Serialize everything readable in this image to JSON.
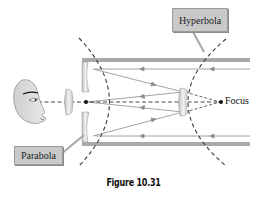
{
  "figure": {
    "caption": "Figure 10.31",
    "labels": {
      "hyperbola": "Hyperbola",
      "parabola": "Parabola",
      "focus": "Focus"
    },
    "colors": {
      "tube": "#a8a8a8",
      "ray": "#8a8a8a",
      "dashed_curve": "#3a3a3a",
      "label_bg": "#c9c9c9",
      "mirror": "#d9d9d9"
    }
  }
}
